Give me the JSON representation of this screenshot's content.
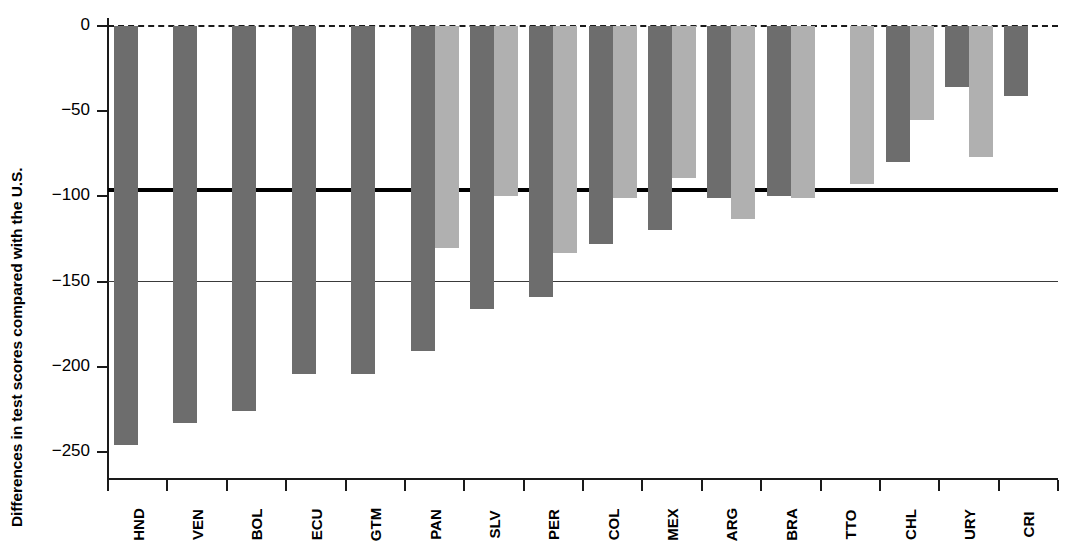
{
  "chart_data": {
    "type": "bar",
    "title": "",
    "xlabel": "",
    "ylabel": "Differences in test scores compared with the U.S.",
    "ylim": [
      -260,
      5
    ],
    "yticks": [
      0,
      -50,
      -100,
      -150,
      -200,
      -250
    ],
    "ytick_labels": [
      "0",
      "−50",
      "−100",
      "−150",
      "−200",
      "−250"
    ],
    "grid": false,
    "legend": "none",
    "categories": [
      "HND",
      "VEN",
      "BOL",
      "ECU",
      "GTM",
      "PAN",
      "SLV",
      "PER",
      "COL",
      "MEX",
      "ARG",
      "BRA",
      "TTO",
      "CHL",
      "URY",
      "CRI"
    ],
    "series": [
      {
        "name": "dark",
        "color": "#6d6d6d",
        "values": [
          -246,
          -233,
          -226,
          -204,
          -204,
          -191,
          -166,
          -159,
          -128,
          -120,
          -101,
          -100,
          null,
          -80,
          -36,
          -41
        ]
      },
      {
        "name": "light",
        "color": "#b0b0b0",
        "values": [
          null,
          null,
          null,
          null,
          null,
          -130,
          -100,
          -133,
          -101,
          -89,
          -113,
          -101,
          -93,
          -55,
          -77,
          null
        ]
      }
    ],
    "reference_lines": [
      {
        "value": 0,
        "style": "dashed",
        "width": 2.5,
        "color": "#1a1a1a"
      },
      {
        "value": -96,
        "style": "solid",
        "width": 4,
        "color": "#000000"
      },
      {
        "value": -150,
        "style": "solid",
        "width": 1.5,
        "color": "#3a3a3a"
      }
    ]
  }
}
